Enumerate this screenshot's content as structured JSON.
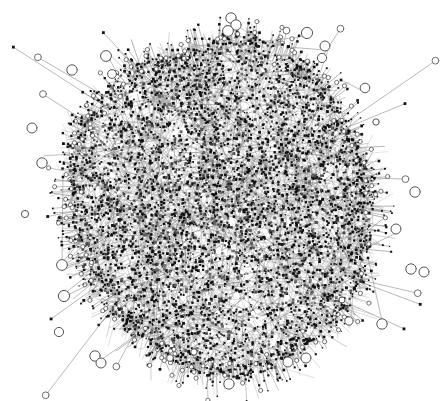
{
  "figure": {
    "kind": "network-graph",
    "title": "Force-directed network graph",
    "width": 445,
    "height": 401,
    "background_color": "#ffffff"
  },
  "chart_data": {
    "type": "scatter",
    "title": "Force-directed network graph",
    "subtitle": "",
    "xlabel": "",
    "ylabel": "",
    "grid": false,
    "legend": "none",
    "axes_visible": false,
    "tick_labels": [],
    "annotations": [],
    "layout": "force-directed",
    "rendering": {
      "node_fill_color": "#111111",
      "node_marker": "square-dot",
      "hollow_node_stroke_color": "#555555",
      "hollow_node_fill_color": "#ffffff",
      "edge_color": "#9a9a9a",
      "edge_color_dark": "#6e6e6e",
      "edge_width": 0.55,
      "long_edge_color": "#8c8c8c",
      "long_edge_width": 0.6
    },
    "giant_component": {
      "label": "giant connected component",
      "center_x": 222,
      "center_y": 206,
      "radius_x": 152,
      "radius_y": 167,
      "core_node_count": 5200,
      "core_edge_count": 9400,
      "core_node_size_min": 1.2,
      "core_node_size_max": 2.9,
      "core_density_exponent": 0.52,
      "core_black_fraction": 0.62
    },
    "fringe": {
      "label": "leaf / pendant nodes on periphery",
      "count": 760,
      "stalk_length_min": 3,
      "stalk_length_max": 26,
      "tip_size_min": 1.1,
      "tip_size_max": 2.8,
      "hollow_tip_fraction": 0.18,
      "hollow_tip_radius": 2.1
    },
    "long_tendrils": {
      "label": "long edges to distant satellite nodes",
      "count": 26,
      "length_min": 28,
      "length_max": 120,
      "endpoint_ring_radius": 3.4
    },
    "isolated_nodes": {
      "label": "isolated / disconnected ring nodes",
      "marker": "hollow-circle",
      "default_radius": 5.0,
      "stroke_width": 1.0,
      "count": 31,
      "points": [
        {
          "x": 231,
          "y": 18,
          "r": 5.2
        },
        {
          "x": 236,
          "y": 25,
          "r": 5.2
        },
        {
          "x": 228,
          "y": 31,
          "r": 5.4
        },
        {
          "x": 307,
          "y": 33,
          "r": 5.6
        },
        {
          "x": 325,
          "y": 46,
          "r": 5.0
        },
        {
          "x": 322,
          "y": 58,
          "r": 4.6
        },
        {
          "x": 106,
          "y": 56,
          "r": 5.4
        },
        {
          "x": 72,
          "y": 70,
          "r": 5.2
        },
        {
          "x": 112,
          "y": 74,
          "r": 4.4
        },
        {
          "x": 365,
          "y": 88,
          "r": 4.8
        },
        {
          "x": 32,
          "y": 128,
          "r": 5.0
        },
        {
          "x": 42,
          "y": 163,
          "r": 5.2
        },
        {
          "x": 415,
          "y": 192,
          "r": 5.2
        },
        {
          "x": 25,
          "y": 214,
          "r": 3.6
        },
        {
          "x": 396,
          "y": 229,
          "r": 5.0
        },
        {
          "x": 62,
          "y": 265,
          "r": 5.4
        },
        {
          "x": 411,
          "y": 269,
          "r": 5.2
        },
        {
          "x": 424,
          "y": 272,
          "r": 5.0
        },
        {
          "x": 64,
          "y": 296,
          "r": 5.6
        },
        {
          "x": 59,
          "y": 332,
          "r": 4.6
        },
        {
          "x": 95,
          "y": 356,
          "r": 5.2
        },
        {
          "x": 101,
          "y": 363,
          "r": 5.0
        },
        {
          "x": 382,
          "y": 324,
          "r": 5.2
        },
        {
          "x": 349,
          "y": 321,
          "r": 4.2
        },
        {
          "x": 288,
          "y": 362,
          "r": 5.0
        },
        {
          "x": 306,
          "y": 358,
          "r": 5.0
        },
        {
          "x": 229,
          "y": 384,
          "r": 5.2
        },
        {
          "x": 170,
          "y": 358,
          "r": 3.4
        },
        {
          "x": 194,
          "y": 352,
          "r": 3.2
        },
        {
          "x": 342,
          "y": 300,
          "r": 3.0
        },
        {
          "x": 376,
          "y": 122,
          "r": 3.2
        }
      ]
    },
    "satellite_links": {
      "label": "explicit long edges drawn between hub and satellites",
      "links": [
        {
          "x1": 307,
          "y1": 36,
          "x2": 252,
          "y2": 43
        },
        {
          "x1": 325,
          "y1": 50,
          "x2": 288,
          "y2": 47
        },
        {
          "x1": 365,
          "y1": 92,
          "x2": 341,
          "y2": 80
        },
        {
          "x1": 62,
          "y1": 262,
          "x2": 63,
          "y2": 177
        },
        {
          "x1": 62,
          "y1": 263,
          "x2": 97,
          "y2": 221
        },
        {
          "x1": 64,
          "y1": 265,
          "x2": 108,
          "y2": 236
        },
        {
          "x1": 64,
          "y1": 267,
          "x2": 113,
          "y2": 252
        },
        {
          "x1": 65,
          "y1": 269,
          "x2": 119,
          "y2": 246
        },
        {
          "x1": 64,
          "y1": 294,
          "x2": 108,
          "y2": 259
        },
        {
          "x1": 64,
          "y1": 297,
          "x2": 122,
          "y2": 268
        },
        {
          "x1": 382,
          "y1": 321,
          "x2": 368,
          "y2": 258
        },
        {
          "x1": 396,
          "y1": 233,
          "x2": 370,
          "y2": 246
        },
        {
          "x1": 101,
          "y1": 360,
          "x2": 163,
          "y2": 316
        },
        {
          "x1": 116,
          "y1": 351,
          "x2": 170,
          "y2": 313
        },
        {
          "x1": 128,
          "y1": 347,
          "x2": 176,
          "y2": 315
        }
      ]
    }
  }
}
